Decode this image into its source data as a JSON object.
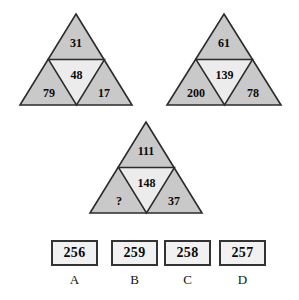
{
  "figure": {
    "type": "triangle-number-puzzle",
    "background_color": "#ffffff",
    "outer_cell_color": "#c9c9c9",
    "center_cell_color": "#ececec",
    "stroke_color": "#2b2b2b",
    "text_color": "#0a0a0a"
  },
  "triangles": [
    {
      "id": "triangle-1",
      "top": "31",
      "center": "48",
      "bottom_left": "79",
      "bottom_right": "17"
    },
    {
      "id": "triangle-2",
      "top": "61",
      "center": "139",
      "bottom_left": "200",
      "bottom_right": "78"
    },
    {
      "id": "triangle-3",
      "top": "111",
      "center": "148",
      "bottom_left": "?",
      "bottom_right": "37"
    }
  ],
  "answers": [
    {
      "letter": "A",
      "value": "256"
    },
    {
      "letter": "B",
      "value": "259"
    },
    {
      "letter": "C",
      "value": "258"
    },
    {
      "letter": "D",
      "value": "257"
    }
  ]
}
